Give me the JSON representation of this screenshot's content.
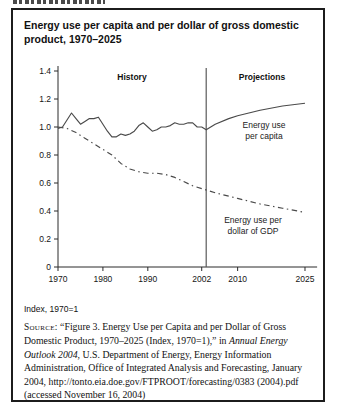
{
  "figure": {
    "title_line1": "Energy use per capita and per dollar of gross domestic",
    "title_line2": "product, 1970–2025",
    "index_note": "Index, 1970=1",
    "source": {
      "label": "Source:",
      "before_italic": " “Figure 3. Energy Use per Capita and per Dollar of Gross Domestic Product, 1970–2025 (Index, 1970=1),” in ",
      "italic": "Annual Energy Outlook 2004",
      "after_italic": ", U.S. Department of Energy, Energy Information Administration, Office of Integrated Analysis and Forecasting, January 2004, http://tonto.eia.doe.gov/FTPROOT/forecasting/0383 (2004).pdf (accessed November 16, 2004)"
    }
  },
  "chart_data": {
    "type": "line",
    "title": "Energy use per capita and per dollar of gross domestic product, 1970–2025",
    "xlabel": "",
    "ylabel": "Index, 1970=1",
    "xlim": [
      1970,
      2027.7
    ],
    "ylim": [
      0,
      1.4
    ],
    "grid": false,
    "x_ticks": [
      1970,
      1980,
      1990,
      2002,
      2010,
      2025
    ],
    "y_ticks": [
      0,
      0.2,
      0.4,
      0.6,
      0.8,
      1.0,
      1.2,
      1.4
    ],
    "divider_year": 2003,
    "era_labels": {
      "history": "History",
      "projections": "Projections"
    },
    "series": [
      {
        "name": "Energy use per capita",
        "label_text": "Energy use\nper capita",
        "style": "solid",
        "points": [
          [
            1970,
            0.99
          ],
          [
            1971,
            1.0
          ],
          [
            1972,
            1.05
          ],
          [
            1973,
            1.1
          ],
          [
            1974,
            1.06
          ],
          [
            1975,
            1.02
          ],
          [
            1976,
            1.04
          ],
          [
            1977,
            1.06
          ],
          [
            1978,
            1.06
          ],
          [
            1979,
            1.07
          ],
          [
            1980,
            1.02
          ],
          [
            1981,
            0.97
          ],
          [
            1982,
            0.93
          ],
          [
            1983,
            0.93
          ],
          [
            1984,
            0.95
          ],
          [
            1985,
            0.94
          ],
          [
            1986,
            0.95
          ],
          [
            1987,
            0.97
          ],
          [
            1988,
            1.01
          ],
          [
            1989,
            1.03
          ],
          [
            1990,
            1.0
          ],
          [
            1991,
            0.97
          ],
          [
            1992,
            0.98
          ],
          [
            1993,
            1.0
          ],
          [
            1994,
            1.0
          ],
          [
            1995,
            1.01
          ],
          [
            1996,
            1.03
          ],
          [
            1997,
            1.02
          ],
          [
            1998,
            1.02
          ],
          [
            1999,
            1.03
          ],
          [
            2000,
            1.03
          ],
          [
            2001,
            1.0
          ],
          [
            2002,
            1.0
          ],
          [
            2003,
            0.98
          ],
          [
            2004,
            1.0
          ],
          [
            2005,
            1.02
          ],
          [
            2008,
            1.06
          ],
          [
            2010,
            1.08
          ],
          [
            2015,
            1.12
          ],
          [
            2020,
            1.15
          ],
          [
            2025,
            1.17
          ]
        ]
      },
      {
        "name": "Energy use per dollar of GDP",
        "label_text": "Energy use per\ndollar of GDP",
        "style": "dashdot",
        "points": [
          [
            1970,
            1.0
          ],
          [
            1972,
            0.99
          ],
          [
            1974,
            0.96
          ],
          [
            1976,
            0.92
          ],
          [
            1978,
            0.88
          ],
          [
            1980,
            0.84
          ],
          [
            1982,
            0.8
          ],
          [
            1984,
            0.74
          ],
          [
            1986,
            0.7
          ],
          [
            1988,
            0.68
          ],
          [
            1990,
            0.67
          ],
          [
            1992,
            0.67
          ],
          [
            1994,
            0.66
          ],
          [
            1996,
            0.64
          ],
          [
            1998,
            0.61
          ],
          [
            2000,
            0.58
          ],
          [
            2002,
            0.56
          ],
          [
            2005,
            0.53
          ],
          [
            2010,
            0.49
          ],
          [
            2015,
            0.45
          ],
          [
            2020,
            0.42
          ],
          [
            2025,
            0.39
          ]
        ]
      }
    ]
  }
}
